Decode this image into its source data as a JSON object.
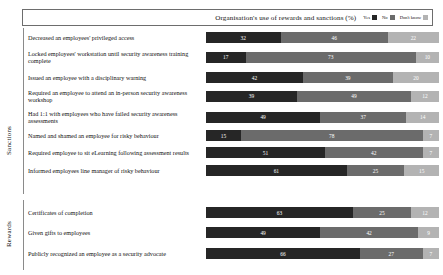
{
  "legend": {
    "title": "Organisation's use of rewards and sanctions (%)",
    "entries": [
      {
        "label": "Yes",
        "color": "#262626"
      },
      {
        "label": "No",
        "color": "#6b6b6b"
      },
      {
        "label": "Don't know",
        "color": "#b3b3b3"
      }
    ]
  },
  "groups": [
    {
      "name": "Sanctions"
    },
    {
      "name": "Rewards"
    }
  ],
  "chart_data": {
    "type": "bar",
    "title": "Organisation's use of rewards and sanctions (%)",
    "orientation": "horizontal",
    "stacked": true,
    "xlabel": "",
    "ylabel": "",
    "xlim": [
      0,
      100
    ],
    "grid": false,
    "legend_position": "top-right",
    "legend_entries": [
      "Yes",
      "No",
      "Don't know"
    ],
    "colors": [
      "#262626",
      "#6b6b6b",
      "#b3b3b3"
    ],
    "categories": [
      "Decreased an employees' privileged access",
      "Locked employees' workstation until security awareness training complete",
      "Issued an employee with a disciplinary warning",
      "Required an employee to attend an in-person security awareness workshop",
      "Had 1:1 with employees who have failed security awareness assessments",
      "Named and shamed an employee for risky behaviour",
      "Required employee to sit eLearning following assessment results",
      "Informed employees line manager of risky behaviour",
      "Certificates of completion",
      "Given gifts to employees",
      "Publicly recognized an employee as a security advocate"
    ],
    "category_groups": [
      "Sanctions",
      "Sanctions",
      "Sanctions",
      "Sanctions",
      "Sanctions",
      "Sanctions",
      "Sanctions",
      "Sanctions",
      "Rewards",
      "Rewards",
      "Rewards"
    ],
    "series": [
      {
        "name": "Yes",
        "values": [
          32,
          17,
          42,
          39,
          49,
          15,
          51,
          61,
          63,
          49,
          66
        ]
      },
      {
        "name": "No",
        "values": [
          46,
          73,
          39,
          49,
          37,
          78,
          42,
          25,
          25,
          42,
          27
        ]
      },
      {
        "name": "Don't know",
        "values": [
          22,
          10,
          20,
          12,
          14,
          7,
          7,
          15,
          12,
          9,
          7
        ]
      }
    ]
  }
}
